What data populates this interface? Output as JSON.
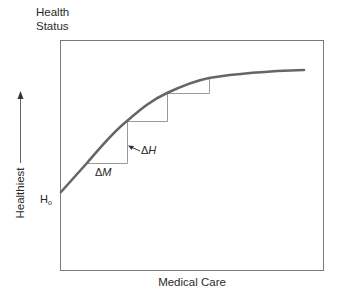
{
  "figure": {
    "y_axis_title_line1": "Health",
    "y_axis_title_line2": "Status",
    "x_axis_title": "Medical Care",
    "direction_label": "Healthiest",
    "baseline_label_main": "H",
    "baseline_label_sub": "o",
    "delta_m_symbol": "Δ",
    "delta_m_var": "M",
    "delta_h_symbol": "Δ",
    "delta_h_var": "H",
    "colors": {
      "curve": "#666666",
      "steps": "#9a9a9a",
      "frame": "#7a7a7a",
      "text": "#2a2a2a"
    }
  }
}
